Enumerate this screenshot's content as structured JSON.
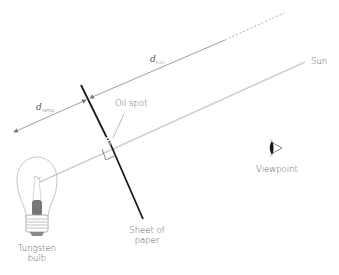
{
  "diagram": {
    "labels": {
      "d_sun": {
        "symbol": "d",
        "subscript": "sun"
      },
      "d_lamp": {
        "symbol": "d",
        "subscript": "lamp"
      },
      "sun": "Sun",
      "oil_spot": "Oil spot",
      "viewpoint": "Viewpoint",
      "sheet_line1": "Sheet of",
      "sheet_line2": "paper",
      "bulb_line1": "Tungsten",
      "bulb_line2": "bulb"
    },
    "colors": {
      "paper": "#1a1a1a",
      "light_ray": "#cccccc",
      "dimension_line": "#888888",
      "text": "#555555"
    }
  }
}
